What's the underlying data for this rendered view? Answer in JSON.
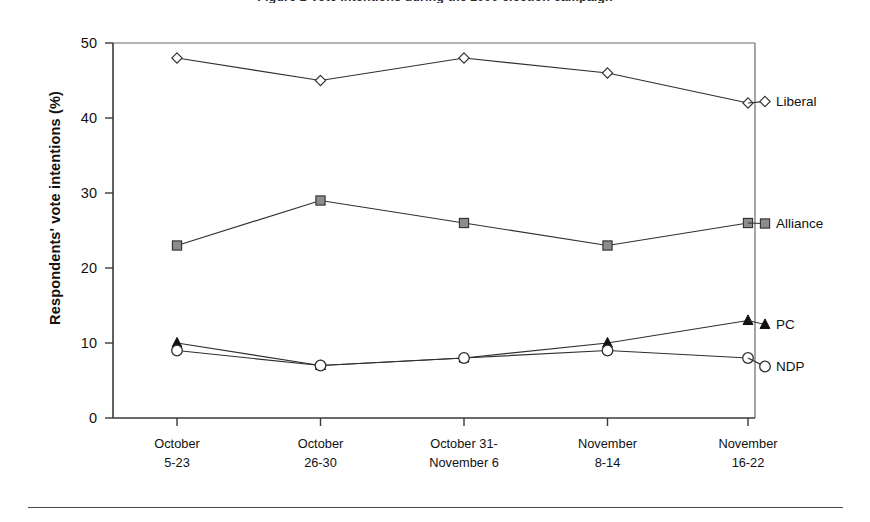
{
  "figure": {
    "clipped_title": "Figure 1 Vote intentions during the 2000 election campaign",
    "footer_rule": true
  },
  "chart_data": {
    "type": "line",
    "title": "",
    "xlabel": "",
    "ylabel": "Respondents' vote intentions (%)",
    "ylim": [
      0,
      50
    ],
    "yticks": [
      "0",
      "10",
      "20",
      "30",
      "40",
      "50"
    ],
    "ytick_values": [
      0,
      10,
      20,
      30,
      40,
      50
    ],
    "grid": false,
    "legend_position": "right-inline-labels",
    "categories": [
      "October\n5-23",
      "October\n26-30",
      "October 31-\nNovember 6",
      "November\n8-14",
      "November\n16-22"
    ],
    "categories_lines": [
      [
        "October",
        "5-23"
      ],
      [
        "October",
        "26-30"
      ],
      [
        "October 31-",
        "November 6"
      ],
      [
        "November",
        "8-14"
      ],
      [
        "November",
        "16-22"
      ]
    ],
    "series": [
      {
        "name": "Liberal",
        "marker": "open-diamond",
        "marker_fill": "#ffffff",
        "marker_stroke": "#2f2f2f",
        "values": [
          48,
          45,
          48,
          46,
          42
        ]
      },
      {
        "name": "Alliance",
        "marker": "filled-square",
        "marker_fill": "#8c8c8c",
        "marker_stroke": "#2f2f2f",
        "values": [
          23,
          29,
          26,
          23,
          26
        ]
      },
      {
        "name": "PC",
        "marker": "filled-triangle",
        "marker_fill": "#111111",
        "marker_stroke": "#111111",
        "values": [
          10,
          7,
          8,
          10,
          13
        ]
      },
      {
        "name": "NDP",
        "marker": "open-circle",
        "marker_fill": "#ffffff",
        "marker_stroke": "#2f2f2f",
        "values": [
          9,
          7,
          8,
          9,
          8
        ]
      }
    ],
    "series_label_positions": [
      {
        "name": "Liberal",
        "x": 776,
        "y": 106
      },
      {
        "name": "Alliance",
        "x": 776,
        "y": 228
      },
      {
        "name": "PC",
        "x": 776,
        "y": 329
      },
      {
        "name": "NDP",
        "x": 776,
        "y": 371
      }
    ]
  },
  "colors": {
    "axis": "#3a3a3a",
    "frame": "#6a6a6a",
    "line": "#2f2f2f",
    "text": "#111111",
    "alliance_marker": "#8c8c8c",
    "pc_marker": "#111111",
    "background": "#ffffff"
  }
}
